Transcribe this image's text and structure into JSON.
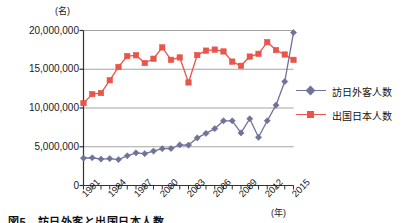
{
  "chart_data": {
    "type": "line",
    "title": "",
    "xlabel": "(年)",
    "ylabel": "(名)",
    "x": [
      1991,
      1992,
      1993,
      1994,
      1995,
      1996,
      1997,
      1998,
      1999,
      2000,
      2001,
      2002,
      2003,
      2004,
      2005,
      2006,
      2007,
      2008,
      2009,
      2010,
      2011,
      2012,
      2013,
      2014,
      2015
    ],
    "categories": [
      "1991",
      "1992",
      "1993",
      "1994",
      "1995",
      "1996",
      "1997",
      "1998",
      "1999",
      "2000",
      "2001",
      "2002",
      "2003",
      "2004",
      "2005",
      "2006",
      "2007",
      "2008",
      "2009",
      "2010",
      "2011",
      "2012",
      "2013",
      "2014",
      "2015"
    ],
    "xtick_labels": [
      "1991",
      "1994",
      "1997",
      "2000",
      "2003",
      "2006",
      "2009",
      "2012",
      "2015"
    ],
    "xtick_values": [
      1991,
      1994,
      1997,
      2000,
      2003,
      2006,
      2009,
      2012,
      2015
    ],
    "ytick_labels": [
      "0",
      "5,000,000",
      "10,000,000",
      "15,000,000",
      "20,000,000"
    ],
    "ytick_values": [
      0,
      5000000,
      10000000,
      15000000,
      20000000
    ],
    "ylim": [
      0,
      20000000
    ],
    "xlim": [
      1991,
      2015
    ],
    "grid": "horizontal",
    "legend_position": "right",
    "series": [
      {
        "name": "訪日外客人数",
        "color": "#6f7299",
        "marker": "diamond",
        "values": [
          3533000,
          3581000,
          3410000,
          3468000,
          3345000,
          3837000,
          4218000,
          4106000,
          4438000,
          4757000,
          4772000,
          5239000,
          5212000,
          6138000,
          6728000,
          7334000,
          8347000,
          8351000,
          6790000,
          8611000,
          6219000,
          8358000,
          10364000,
          13413000,
          19737000
        ]
      },
      {
        "name": "出国日本人数",
        "color": "#e8554a",
        "marker": "square",
        "values": [
          10634000,
          11791000,
          11934000,
          13579000,
          15298000,
          16695000,
          16803000,
          15806000,
          16358000,
          17819000,
          16216000,
          16523000,
          13296000,
          16831000,
          17404000,
          17535000,
          17295000,
          15987000,
          15446000,
          16637000,
          16994000,
          18491000,
          17473000,
          16903000,
          16214000
        ]
      }
    ]
  },
  "legend": {
    "entries": [
      {
        "label": "訪日外客人数"
      },
      {
        "label": "出国日本人数"
      }
    ]
  },
  "caption": {
    "text": "図5　訪日外客と出国日本人数"
  },
  "colors": {
    "series_blue": "#6f7299",
    "series_red": "#e8554a",
    "grid": "#9a9a9a",
    "axis": "#333333"
  }
}
